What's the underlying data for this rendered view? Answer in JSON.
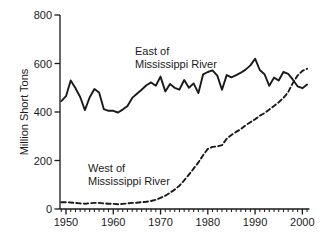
{
  "chart_data": {
    "type": "line",
    "title": "",
    "xlabel": "",
    "ylabel": "Million Short Tons",
    "xlim": [
      1948.7,
      2001.5
    ],
    "ylim": [
      0,
      800
    ],
    "grid": false,
    "legend_position": "in-plot annotations",
    "colors": {
      "line": "#1a1a1a",
      "background": "#ffffff"
    },
    "x_ticks_major": [
      1950,
      1960,
      1970,
      1980,
      1990,
      2000
    ],
    "x_minor_tick_years": [
      1949,
      2001
    ],
    "y_ticks": [
      0,
      200,
      400,
      600,
      800
    ],
    "x": [
      1949,
      1950,
      1951,
      1952,
      1953,
      1954,
      1955,
      1956,
      1957,
      1958,
      1959,
      1960,
      1961,
      1962,
      1963,
      1964,
      1965,
      1966,
      1967,
      1968,
      1969,
      1970,
      1971,
      1972,
      1973,
      1974,
      1975,
      1976,
      1977,
      1978,
      1979,
      1980,
      1981,
      1982,
      1983,
      1984,
      1985,
      1986,
      1987,
      1988,
      1989,
      1990,
      1991,
      1992,
      1993,
      1994,
      1995,
      1996,
      1997,
      1998,
      1999,
      2000,
      2001
    ],
    "series": [
      {
        "name": "East of Mississippi River",
        "style": "solid",
        "values": [
          445,
          465,
          530,
          498,
          462,
          408,
          460,
          495,
          480,
          412,
          405,
          405,
          398,
          410,
          425,
          458,
          475,
          492,
          510,
          522,
          508,
          546,
          485,
          516,
          500,
          492,
          532,
          500,
          518,
          478,
          555,
          565,
          572,
          550,
          492,
          552,
          543,
          552,
          562,
          575,
          592,
          620,
          573,
          556,
          508,
          542,
          530,
          565,
          557,
          533,
          506,
          498,
          513
        ]
      },
      {
        "name": "West of Mississippi River",
        "style": "dashed",
        "values": [
          28,
          28,
          27,
          25,
          23,
          22,
          24,
          25,
          25,
          23,
          22,
          21,
          20,
          21,
          23,
          25,
          26,
          28,
          30,
          33,
          38,
          46,
          55,
          67,
          80,
          96,
          118,
          142,
          166,
          192,
          222,
          248,
          256,
          258,
          263,
          290,
          305,
          318,
          330,
          345,
          358,
          370,
          385,
          395,
          410,
          425,
          440,
          458,
          482,
          520,
          550,
          570,
          578
        ]
      }
    ],
    "annotations": [
      {
        "id": "east",
        "line1": "East of",
        "line2": "Mississippi River"
      },
      {
        "id": "west",
        "line1": "West of",
        "line2": "Mississippi River"
      }
    ]
  }
}
